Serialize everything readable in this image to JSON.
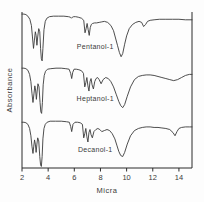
{
  "figure": {
    "background_color": "#fdfdfd",
    "line_color": "#3a3a3a",
    "axis_color": "#2b2b2b"
  },
  "chart_data": {
    "type": "line",
    "title": "",
    "xlabel": "Micra",
    "ylabel": "Absorbance",
    "xlim": [
      2,
      15
    ],
    "ylim": [
      0,
      3
    ],
    "grid": false,
    "legend_position": "inline-annotations",
    "xticks": [
      2,
      4,
      6,
      8,
      10,
      12,
      14
    ],
    "xtick_labels": [
      "2",
      "4",
      "6",
      "8",
      "10",
      "12",
      "14"
    ],
    "yticks": [],
    "ytick_labels": [],
    "annotations": [
      {
        "text": "Pentanol-1",
        "x": 7.6,
        "y": 2.28
      },
      {
        "text": "Heptanol-1",
        "x": 7.6,
        "y": 1.28
      },
      {
        "text": "Decanol-1",
        "x": 7.6,
        "y": 0.3
      }
    ],
    "series": [
      {
        "name": "Pentanol-1",
        "label": "Pentanol-1",
        "color": "#3a3a3a",
        "offset": 2,
        "x": [
          2.0,
          2.15,
          2.3,
          2.45,
          2.6,
          2.72,
          2.8,
          2.88,
          2.95,
          3.02,
          3.08,
          3.14,
          3.2,
          3.28,
          3.36,
          3.42,
          3.48,
          3.54,
          3.6,
          3.68,
          3.78,
          3.9,
          4.1,
          4.4,
          4.8,
          5.2,
          5.55,
          5.7,
          5.78,
          5.85,
          5.95,
          6.1,
          6.3,
          6.55,
          6.72,
          6.82,
          6.9,
          6.98,
          7.06,
          7.14,
          7.22,
          7.3,
          7.4,
          7.55,
          7.7,
          7.9,
          8.1,
          8.3,
          8.55,
          8.8,
          9.0,
          9.15,
          9.3,
          9.45,
          9.58,
          9.7,
          9.85,
          10.0,
          10.2,
          10.45,
          10.7,
          10.95,
          11.15,
          11.3,
          11.45,
          11.6,
          11.8,
          12.1,
          12.5,
          13.0,
          13.5,
          14.0,
          14.5,
          15.0
        ],
        "y": [
          0.96,
          0.96,
          0.95,
          0.92,
          0.86,
          0.74,
          0.52,
          0.3,
          0.46,
          0.62,
          0.55,
          0.36,
          0.52,
          0.68,
          0.62,
          0.3,
          0.1,
          0.06,
          0.3,
          0.66,
          0.82,
          0.88,
          0.91,
          0.92,
          0.92,
          0.92,
          0.91,
          0.9,
          0.88,
          0.9,
          0.91,
          0.91,
          0.9,
          0.88,
          0.84,
          0.6,
          0.68,
          0.78,
          0.66,
          0.55,
          0.7,
          0.76,
          0.78,
          0.79,
          0.79,
          0.8,
          0.81,
          0.82,
          0.8,
          0.74,
          0.64,
          0.5,
          0.36,
          0.22,
          0.14,
          0.2,
          0.38,
          0.54,
          0.68,
          0.76,
          0.8,
          0.82,
          0.8,
          0.72,
          0.76,
          0.82,
          0.84,
          0.85,
          0.86,
          0.86,
          0.86,
          0.86,
          0.85,
          0.85
        ]
      },
      {
        "name": "Heptanol-1",
        "label": "Heptanol-1",
        "color": "#3a3a3a",
        "offset": 1,
        "x": [
          2.0,
          2.15,
          2.3,
          2.45,
          2.58,
          2.68,
          2.76,
          2.84,
          2.92,
          2.98,
          3.04,
          3.1,
          3.16,
          3.22,
          3.3,
          3.38,
          3.44,
          3.5,
          3.56,
          3.62,
          3.7,
          3.8,
          3.95,
          4.2,
          4.6,
          5.0,
          5.35,
          5.6,
          5.72,
          5.8,
          5.88,
          5.98,
          6.15,
          6.35,
          6.55,
          6.7,
          6.8,
          6.88,
          6.96,
          7.04,
          7.12,
          7.2,
          7.28,
          7.36,
          7.46,
          7.56,
          7.66,
          7.78,
          7.9,
          8.05,
          8.2,
          8.4,
          8.6,
          8.8,
          9.0,
          9.2,
          9.4,
          9.55,
          9.7,
          9.85,
          10.05,
          10.3,
          10.6,
          10.9,
          11.2,
          11.5,
          11.8,
          12.1,
          12.4,
          12.7,
          13.0,
          13.3,
          13.6,
          13.9,
          14.2,
          14.5,
          14.8,
          15.0
        ],
        "y": [
          0.92,
          0.92,
          0.91,
          0.88,
          0.8,
          0.66,
          0.44,
          0.26,
          0.44,
          0.58,
          0.5,
          0.32,
          0.48,
          0.62,
          0.56,
          0.26,
          0.08,
          0.05,
          0.26,
          0.6,
          0.78,
          0.86,
          0.9,
          0.91,
          0.92,
          0.92,
          0.91,
          0.9,
          0.82,
          0.72,
          0.84,
          0.9,
          0.9,
          0.89,
          0.87,
          0.82,
          0.56,
          0.64,
          0.74,
          0.58,
          0.48,
          0.66,
          0.72,
          0.6,
          0.52,
          0.66,
          0.72,
          0.74,
          0.7,
          0.62,
          0.7,
          0.74,
          0.72,
          0.66,
          0.56,
          0.42,
          0.28,
          0.2,
          0.16,
          0.22,
          0.38,
          0.56,
          0.7,
          0.76,
          0.78,
          0.79,
          0.79,
          0.78,
          0.76,
          0.74,
          0.72,
          0.7,
          0.68,
          0.7,
          0.74,
          0.78,
          0.8,
          0.8
        ]
      },
      {
        "name": "Decanol-1",
        "label": "Decanol-1",
        "color": "#3a3a3a",
        "offset": 0,
        "x": [
          2.0,
          2.15,
          2.3,
          2.45,
          2.58,
          2.68,
          2.76,
          2.84,
          2.9,
          2.96,
          3.02,
          3.08,
          3.14,
          3.2,
          3.28,
          3.36,
          3.42,
          3.48,
          3.54,
          3.6,
          3.68,
          3.78,
          3.92,
          4.15,
          4.55,
          5.0,
          5.4,
          5.62,
          5.72,
          5.8,
          5.9,
          6.05,
          6.25,
          6.45,
          6.62,
          6.72,
          6.8,
          6.88,
          6.96,
          7.04,
          7.12,
          7.2,
          7.28,
          7.38,
          7.5,
          7.65,
          7.8,
          7.95,
          8.1,
          8.3,
          8.5,
          8.7,
          8.9,
          9.1,
          9.25,
          9.4,
          9.55,
          9.7,
          9.85,
          10.05,
          10.3,
          10.6,
          10.9,
          11.2,
          11.5,
          11.8,
          12.1,
          12.4,
          12.7,
          13.0,
          13.3,
          13.55,
          13.7,
          13.85,
          14.0,
          14.2,
          14.5,
          14.8,
          15.0
        ],
        "y": [
          0.88,
          0.88,
          0.87,
          0.84,
          0.76,
          0.62,
          0.42,
          0.28,
          0.42,
          0.54,
          0.46,
          0.3,
          0.46,
          0.58,
          0.52,
          0.22,
          0.06,
          0.03,
          0.22,
          0.56,
          0.76,
          0.84,
          0.88,
          0.9,
          0.9,
          0.9,
          0.89,
          0.88,
          0.8,
          0.7,
          0.84,
          0.88,
          0.88,
          0.87,
          0.84,
          0.58,
          0.66,
          0.76,
          0.6,
          0.5,
          0.68,
          0.74,
          0.64,
          0.58,
          0.7,
          0.74,
          0.76,
          0.74,
          0.7,
          0.72,
          0.74,
          0.72,
          0.66,
          0.56,
          0.44,
          0.32,
          0.24,
          0.22,
          0.3,
          0.46,
          0.62,
          0.72,
          0.76,
          0.78,
          0.79,
          0.79,
          0.78,
          0.78,
          0.77,
          0.76,
          0.74,
          0.68,
          0.62,
          0.7,
          0.76,
          0.78,
          0.79,
          0.79,
          0.79
        ]
      }
    ]
  }
}
